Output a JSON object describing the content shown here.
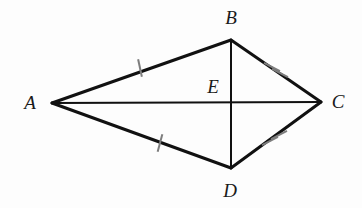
{
  "figure": {
    "background_color": "#fdfdfd",
    "stroke_color": "#111111",
    "tick_color": "#7d7d7d",
    "label_color": "#1a1a1a",
    "width": 362,
    "height": 208
  },
  "points": [
    {
      "name": "A",
      "label": "A",
      "x": 52,
      "y": 103,
      "label_x": 30,
      "label_y": 102
    },
    {
      "name": "B",
      "label": "B",
      "x": 231,
      "y": 40,
      "label_x": 231,
      "label_y": 17
    },
    {
      "name": "C",
      "label": "C",
      "x": 321,
      "y": 102,
      "label_x": 338,
      "label_y": 101
    },
    {
      "name": "D",
      "label": "D",
      "x": 231,
      "y": 168,
      "label_x": 230,
      "label_y": 190
    },
    {
      "name": "E",
      "label": "E",
      "x": 231,
      "y": 103,
      "label_x": 213,
      "label_y": 86
    }
  ],
  "segments": [
    {
      "name": "AB",
      "from": "A",
      "to": "B",
      "x1": 52,
      "y1": 103,
      "x2": 231,
      "y2": 40,
      "width": 3,
      "ticks": 1
    },
    {
      "name": "BC",
      "from": "B",
      "to": "C",
      "x1": 231,
      "y1": 40,
      "x2": 321,
      "y2": 102,
      "width": 3,
      "ticks": 2
    },
    {
      "name": "AD",
      "from": "A",
      "to": "D",
      "x1": 52,
      "y1": 103,
      "x2": 231,
      "y2": 168,
      "width": 3,
      "ticks": 1
    },
    {
      "name": "DC",
      "from": "D",
      "to": "C",
      "x1": 231,
      "y1": 168,
      "x2": 321,
      "y2": 102,
      "width": 3,
      "ticks": 2
    },
    {
      "name": "AC",
      "from": "A",
      "to": "C",
      "x1": 52,
      "y1": 103,
      "x2": 321,
      "y2": 102,
      "width": 2,
      "ticks": 0
    },
    {
      "name": "BD",
      "from": "B",
      "to": "D",
      "x1": 231,
      "y1": 40,
      "x2": 231,
      "y2": 168,
      "width": 2,
      "ticks": 0
    }
  ],
  "tick_marks": [
    {
      "name": "tick-ab-1",
      "segment": "AB",
      "cx": 140,
      "cy": 68,
      "angle_deg": 78,
      "length": 18,
      "width": 2
    },
    {
      "name": "tick-bc-1",
      "segment": "BC",
      "cx": 272,
      "cy": 67,
      "angle_deg": 28,
      "length": 18,
      "width": 2
    },
    {
      "name": "tick-bc-2",
      "segment": "BC",
      "cx": 280,
      "cy": 73,
      "angle_deg": 28,
      "length": 18,
      "width": 2
    },
    {
      "name": "tick-ad-1",
      "segment": "AD",
      "cx": 160,
      "cy": 143,
      "angle_deg": 105,
      "length": 18,
      "width": 2
    },
    {
      "name": "tick-dc-1",
      "segment": "DC",
      "cx": 270,
      "cy": 141,
      "angle_deg": 152,
      "length": 18,
      "width": 2
    },
    {
      "name": "tick-dc-2",
      "segment": "DC",
      "cx": 279,
      "cy": 135,
      "angle_deg": 152,
      "length": 18,
      "width": 2
    }
  ],
  "chart_data": {
    "type": "diagram",
    "shape": "kite",
    "vertices": [
      "A",
      "B",
      "C",
      "D"
    ],
    "interior_point": "E",
    "sides": [
      "AB",
      "BC",
      "CD",
      "DA"
    ],
    "diagonals": [
      "AC",
      "BD"
    ],
    "congruence_marks": {
      "single_tick": [
        "AB",
        "AD"
      ],
      "double_tick": [
        "BC",
        "DC"
      ]
    }
  }
}
